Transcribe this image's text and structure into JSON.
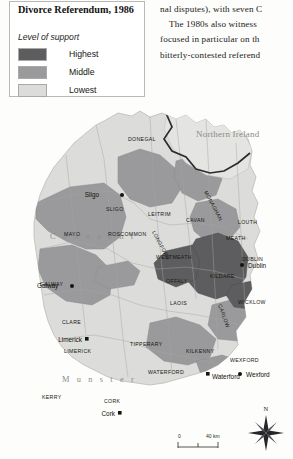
{
  "figure": {
    "legend": {
      "title": "Divorce Referendum, 1986",
      "subtitle": "Level of support",
      "items": [
        {
          "label": "Highest",
          "color": "#5d5d5f"
        },
        {
          "label": "Middle",
          "color": "#9a9a9c"
        },
        {
          "label": "Lowest",
          "color": "#dcdcda"
        }
      ]
    },
    "scale_bar": {
      "start": "0",
      "end": "40 km"
    },
    "compass": {
      "north_label": "N"
    }
  },
  "map": {
    "region_label": "Northern Ireland",
    "provinces": [
      {
        "name": "C o n n a c h t"
      },
      {
        "name": "M u n s t e r"
      }
    ],
    "counties": [
      {
        "name": "DONEGAL"
      },
      {
        "name": "SLIGO"
      },
      {
        "name": "LEITRIM"
      },
      {
        "name": "CAVAN"
      },
      {
        "name": "MONAGHAN"
      },
      {
        "name": "LOUTH"
      },
      {
        "name": "MAYO"
      },
      {
        "name": "ROSCOMMON"
      },
      {
        "name": "LONGFORD"
      },
      {
        "name": "MEATH"
      },
      {
        "name": "WESTMEATH"
      },
      {
        "name": "DUBLIN"
      },
      {
        "name": "GALWAY"
      },
      {
        "name": "OFFALY"
      },
      {
        "name": "KILDARE"
      },
      {
        "name": "LAOIS"
      },
      {
        "name": "CARLOW"
      },
      {
        "name": "WICKLOW"
      },
      {
        "name": "CLARE"
      },
      {
        "name": "LIMERICK"
      },
      {
        "name": "TIPPERARY"
      },
      {
        "name": "KILKENNY"
      },
      {
        "name": "WEXFORD"
      },
      {
        "name": "KERRY"
      },
      {
        "name": "CORK"
      },
      {
        "name": "WATERFORD"
      }
    ],
    "cities": [
      {
        "name": "Sligo"
      },
      {
        "name": "Galway"
      },
      {
        "name": "Dublin"
      },
      {
        "name": "Limerick"
      },
      {
        "name": "Wexford"
      },
      {
        "name": "Waterford"
      },
      {
        "name": "Cork"
      }
    ]
  },
  "body_text": {
    "lines": [
      "nal disputes), with seven C",
      "The 1980s also witness",
      "focused in particular on th",
      "bitterly-contested referend"
    ]
  }
}
